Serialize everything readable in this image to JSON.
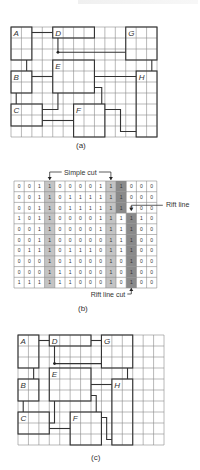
{
  "header_clip": "",
  "panel_a": {
    "caption": "(a)",
    "grid": {
      "x": 11,
      "y": 27,
      "cols": 14,
      "rows": 10,
      "cw": 10.43,
      "ch": 11
    },
    "regions": [
      {
        "label": "A",
        "c0": 0,
        "r0": 0,
        "c1": 2,
        "r1": 3
      },
      {
        "label": "D",
        "c0": 4,
        "r0": 0,
        "c1": 8,
        "r1": 1
      },
      {
        "label": "G",
        "c0": 11,
        "r0": 0,
        "c1": 14,
        "r1": 3
      },
      {
        "label": "E",
        "c0": 4,
        "r0": 3,
        "c1": 8,
        "r1": 6
      },
      {
        "label": "B",
        "c0": 0,
        "r0": 4,
        "c1": 2,
        "r1": 6
      },
      {
        "label": "H",
        "c0": 12,
        "r0": 4,
        "c1": 14,
        "r1": 10
      },
      {
        "label": "C",
        "c0": 0,
        "r0": 7,
        "c1": 3,
        "r1": 9
      },
      {
        "label": "F",
        "c0": 6,
        "r0": 7,
        "c1": 9,
        "r1": 10
      }
    ]
  },
  "panel_b": {
    "caption": "(b)",
    "labels": {
      "simple_cut": "Simple cut",
      "rift_line": "Rift line",
      "rift_line_cut": "Rift line cut"
    },
    "grid": {
      "x": 14,
      "y": 181,
      "cols": 14,
      "rows": 10,
      "cw": 10.2,
      "ch": 10.7
    },
    "values": [
      [
        0,
        0,
        1,
        1,
        0,
        0,
        0,
        0,
        1,
        1,
        1,
        0,
        0,
        0
      ],
      [
        0,
        0,
        1,
        1,
        0,
        1,
        1,
        1,
        1,
        1,
        1,
        0,
        0,
        0
      ],
      [
        0,
        0,
        1,
        1,
        0,
        1,
        1,
        1,
        1,
        1,
        1,
        0,
        0,
        0
      ],
      [
        1,
        0,
        1,
        1,
        0,
        0,
        0,
        0,
        1,
        1,
        1,
        1,
        1,
        0
      ],
      [
        0,
        0,
        1,
        1,
        0,
        0,
        0,
        0,
        1,
        1,
        1,
        1,
        0,
        0
      ],
      [
        0,
        0,
        1,
        1,
        0,
        0,
        0,
        0,
        0,
        1,
        1,
        1,
        0,
        0
      ],
      [
        0,
        1,
        1,
        1,
        0,
        1,
        1,
        1,
        0,
        1,
        1,
        1,
        0,
        0
      ],
      [
        0,
        0,
        0,
        1,
        0,
        1,
        0,
        0,
        0,
        1,
        0,
        1,
        0,
        0
      ],
      [
        0,
        0,
        0,
        1,
        1,
        1,
        0,
        0,
        0,
        1,
        0,
        1,
        0,
        0
      ],
      [
        1,
        1,
        1,
        1,
        1,
        1,
        0,
        0,
        0,
        1,
        0,
        1,
        0,
        0
      ]
    ],
    "shading": {
      "simple_cut_cols": [
        3,
        9
      ],
      "simple_cut_color": "#c4c4c4",
      "rift_color": "#8a8a8a",
      "rift_cells": [
        [
          0,
          10
        ],
        [
          1,
          10
        ],
        [
          2,
          10
        ],
        [
          3,
          11
        ],
        [
          4,
          11
        ],
        [
          5,
          11
        ],
        [
          6,
          11
        ],
        [
          7,
          11
        ],
        [
          8,
          11
        ],
        [
          9,
          11
        ]
      ]
    }
  },
  "panel_c": {
    "caption": "(c)",
    "grid": {
      "x": 18,
      "y": 335,
      "cols": 14,
      "rows": 10,
      "cw": 10.43,
      "ch": 11
    },
    "regions": [
      {
        "label": "A",
        "c0": 0,
        "r0": 0,
        "c1": 2,
        "r1": 3
      },
      {
        "label": "D",
        "c0": 3,
        "r0": 0,
        "c1": 7,
        "r1": 1
      },
      {
        "label": "G",
        "c0": 8,
        "r0": 0,
        "c1": 11,
        "r1": 3
      },
      {
        "label": "E",
        "c0": 3,
        "r0": 3,
        "c1": 7,
        "r1": 6
      },
      {
        "label": "B",
        "c0": 0,
        "r0": 4,
        "c1": 2,
        "r1": 6
      },
      {
        "label": "H",
        "c0": 9,
        "r0": 4,
        "c1": 11,
        "r1": 10
      },
      {
        "label": "C",
        "c0": 0,
        "r0": 7,
        "c1": 3,
        "r1": 9
      },
      {
        "label": "F",
        "c0": 5,
        "r0": 7,
        "c1": 8,
        "r1": 10
      }
    ]
  }
}
